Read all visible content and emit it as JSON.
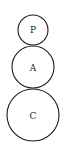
{
  "diagram": {
    "type": "stacked-circles",
    "nodes": [
      {
        "id": "P",
        "label": "P",
        "cx": 33,
        "cy": 30,
        "r": 15
      },
      {
        "id": "A",
        "label": "A",
        "cx": 33,
        "cy": 67,
        "r": 21
      },
      {
        "id": "C",
        "label": "C",
        "cx": 33,
        "cy": 115,
        "r": 26
      }
    ],
    "colors": {
      "stroke": "#1a1a1a",
      "fill": "#ffffff",
      "text": "#222222"
    }
  }
}
